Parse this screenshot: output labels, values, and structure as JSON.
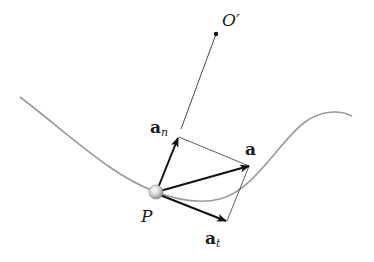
{
  "diagram": {
    "colors": {
      "background": "#ffffff",
      "curve": "#9a9a9a",
      "vector": "#111111",
      "construction_line": "#333333",
      "particle": "#cfcfcf"
    },
    "labels": {
      "center_of_curvature": "O′",
      "particle": "P",
      "acceleration": "a",
      "normal_component_base": "a",
      "normal_component_sub": "n",
      "tangential_component_base": "a",
      "tangential_component_sub": "t"
    },
    "points": {
      "O_prime": [
        216,
        34
      ],
      "P": [
        156,
        192
      ],
      "a_tip": [
        249,
        166
      ],
      "an_tip": [
        178,
        138
      ],
      "at_tip": [
        226,
        221
      ]
    }
  }
}
